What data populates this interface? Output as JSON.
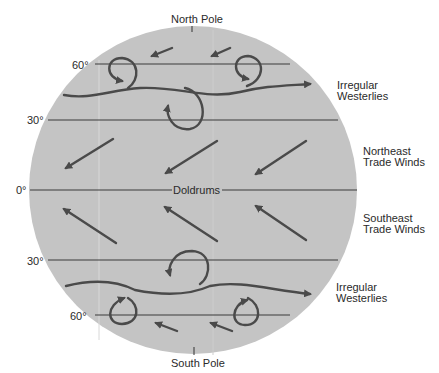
{
  "diagram": {
    "globe_color": "#c4c4c4",
    "line_color": "#3a3a3a",
    "arrow_color": "#4a4a4a",
    "poles": {
      "north": "North Pole",
      "south": "South Pole"
    },
    "latitudes": {
      "n60": "60°",
      "n30": "30°",
      "eq": "0°",
      "s30": "30°",
      "s60": "60°"
    },
    "equator_label": "Doldrums",
    "wind_labels": {
      "north_westerlies": [
        "Irregular",
        "Westerlies"
      ],
      "ne_trades": [
        "Northeast",
        "Trade Winds"
      ],
      "se_trades": [
        "Southeast",
        "Trade Winds"
      ],
      "south_westerlies": [
        "Irregular",
        "Westerlies"
      ]
    }
  }
}
